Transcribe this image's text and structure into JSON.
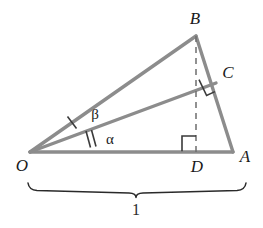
{
  "figure": {
    "kind": "geometry-diagram",
    "canvas": {
      "width": 263,
      "height": 228
    },
    "colors": {
      "stroke_main": "#8c8c8c",
      "stroke_dashed": "#6e6e6e",
      "stroke_marker": "#3a3a3a",
      "text": "#1a1a1a",
      "background": "#ffffff"
    },
    "points": {
      "O": {
        "label": "O",
        "x": 30,
        "y": 152,
        "label_x": 22,
        "label_y": 171
      },
      "A": {
        "label": "A",
        "x": 233,
        "y": 152,
        "label_x": 243,
        "label_y": 161
      },
      "B": {
        "label": "B",
        "x": 196,
        "y": 36,
        "label_x": 193,
        "label_y": 23
      },
      "C": {
        "label": "C",
        "x": 216,
        "y": 83,
        "label_x": 224,
        "label_y": 78
      },
      "D": {
        "label": "D",
        "x": 196,
        "y": 152,
        "label_x": 197,
        "label_y": 171
      }
    },
    "segments": [
      {
        "name": "OA",
        "from": "O",
        "to": "A",
        "style": "solid"
      },
      {
        "name": "OB",
        "from": "O",
        "to": "B",
        "style": "solid"
      },
      {
        "name": "BA",
        "from": "B",
        "to": "A",
        "style": "solid"
      },
      {
        "name": "OC",
        "from": "O",
        "to": "C",
        "style": "solid"
      },
      {
        "name": "BD",
        "from": "B",
        "to": "D",
        "style": "dashed"
      }
    ],
    "angles": [
      {
        "name": "beta",
        "label": "β",
        "at": "O",
        "between": [
          "OC",
          "OB"
        ],
        "ticks": 1,
        "label_x": 95,
        "label_y": 119
      },
      {
        "name": "alpha",
        "label": "α",
        "at": "O",
        "between": [
          "OA",
          "OC"
        ],
        "ticks": 2,
        "label_x": 110,
        "label_y": 144
      }
    ],
    "right_angles": [
      {
        "name": "right-angle-at-C",
        "vertex": "C",
        "note": "OC perpendicular to BA"
      },
      {
        "name": "right-angle-at-D",
        "vertex": "D",
        "note": "BD perpendicular to OA"
      }
    ],
    "brace": {
      "name": "length-brace",
      "label": "1",
      "measures": "OA",
      "x_start": 28,
      "x_end": 246,
      "y": 188,
      "label_x": 136,
      "label_y": 214
    }
  }
}
